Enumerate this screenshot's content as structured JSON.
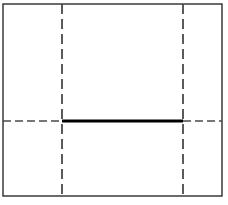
{
  "figure": {
    "type": "line-diagram",
    "canvas": {
      "width": 228,
      "height": 205,
      "background": "#ffffff"
    }
  },
  "colors": {
    "frame_stroke": "#3a3a3a",
    "dashed_stroke": "#4a4a4a",
    "solid_stroke": "#000000",
    "background": "#ffffff"
  },
  "chart_data": {
    "type": "line",
    "xlabel": "",
    "ylabel": "",
    "xlim": [
      0,
      228
    ],
    "ylim": [
      0,
      205
    ],
    "grid": false,
    "legend": null,
    "annotations": [],
    "elements": [
      {
        "name": "outer-frame",
        "kind": "rectangle",
        "x": 3,
        "y": 4,
        "width": 219,
        "height": 192,
        "stroke": "#3a3a3a",
        "stroke_width": 1.5,
        "style": "solid"
      },
      {
        "name": "vertical-construction-line-left",
        "kind": "line",
        "x1": 62,
        "y1": 4,
        "x2": 62,
        "y2": 196,
        "stroke": "#4a4a4a",
        "stroke_width": 1.8,
        "style": "dashed",
        "dash_pattern": "10 5"
      },
      {
        "name": "vertical-construction-line-right",
        "kind": "line",
        "x1": 183,
        "y1": 4,
        "x2": 183,
        "y2": 196,
        "stroke": "#4a4a4a",
        "stroke_width": 1.8,
        "style": "dashed",
        "dash_pattern": "10 5"
      },
      {
        "name": "horizontal-construction-line-left",
        "kind": "line",
        "x1": 3,
        "y1": 121,
        "x2": 62,
        "y2": 121,
        "stroke": "#4a4a4a",
        "stroke_width": 1.6,
        "style": "dashed",
        "dash_pattern": "8 4"
      },
      {
        "name": "horizontal-construction-line-right",
        "kind": "line",
        "x1": 183,
        "y1": 121,
        "x2": 222,
        "y2": 121,
        "stroke": "#4a4a4a",
        "stroke_width": 1.6,
        "style": "dashed",
        "dash_pattern": "8 4"
      },
      {
        "name": "bold-horizontal-segment",
        "kind": "line",
        "x1": 62,
        "y1": 121,
        "x2": 183,
        "y2": 121,
        "stroke": "#000000",
        "stroke_width": 3,
        "style": "solid"
      }
    ]
  }
}
